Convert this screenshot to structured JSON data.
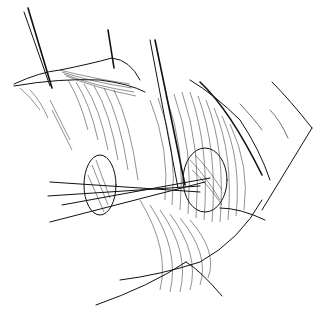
{
  "illustration": {
    "subject": "surgical line drawing",
    "background": "#ffffff",
    "ink": "#111111",
    "elements": [
      "retracted-tissue-flap",
      "forceps-upper",
      "scissors",
      "forceps-lower",
      "tissue-flap-left",
      "tissue-flap-center",
      "retractor-right",
      "retractor-bottom"
    ]
  }
}
